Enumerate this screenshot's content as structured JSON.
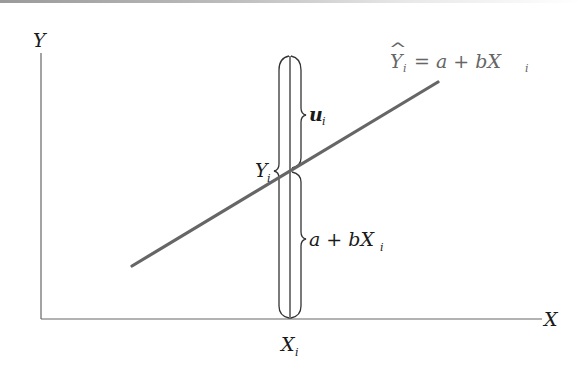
{
  "diagram": {
    "axes": {
      "y_label": "Y",
      "x_label": "X"
    },
    "regression_line": {
      "equation_lhs": "Y",
      "equation_lhs_hat": "^",
      "equation_lhs_sub": "i",
      "equation_rhs_main": "= a + bX",
      "equation_rhs_sub": "i",
      "color": "#666666"
    },
    "observation": {
      "x_tick_label": "X",
      "x_tick_sub": "i",
      "yi_label": "Y",
      "yi_sub": "i",
      "ui_label": "u",
      "ui_sub": "i",
      "fitted_label": "a + bX",
      "fitted_sub": "i"
    },
    "colors": {
      "axis": "#666666",
      "brace": "#333333",
      "text": "#1a1a1a",
      "equation_text": "#666666"
    }
  }
}
